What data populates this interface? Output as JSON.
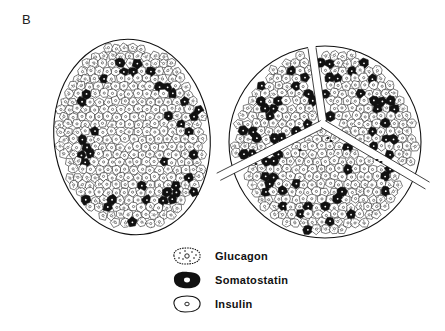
{
  "panel_label": "B",
  "figure": {
    "islets": [
      {
        "name": "left-islet",
        "description": "Islet with insulin core, somatostatin and glucagon cells at periphery"
      },
      {
        "name": "right-islet",
        "description": "Lobulated islet divided by branching capillary septa"
      }
    ]
  },
  "legend": {
    "items": [
      {
        "key": "glucagon",
        "label": "Glucagon",
        "icon": "dotted-cell-icon"
      },
      {
        "key": "somatostatin",
        "label": "Somatostatin",
        "icon": "black-cell-icon"
      },
      {
        "key": "insulin",
        "label": "Insulin",
        "icon": "clear-cell-icon"
      }
    ]
  },
  "colors": {
    "ink": "#111111",
    "background": "#ffffff"
  }
}
